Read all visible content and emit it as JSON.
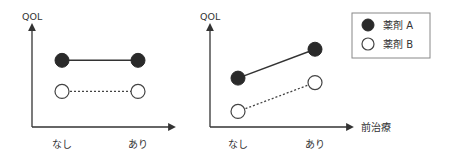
{
  "chart_data": [
    {
      "type": "line",
      "title": "",
      "xlabel": "",
      "ylabel": "QOL",
      "categories": [
        "なし",
        "あり"
      ],
      "series": [
        {
          "name": "薬剤 A",
          "values": [
            3,
            3
          ],
          "style": "solid",
          "marker": "filled"
        },
        {
          "name": "薬剤 B",
          "values": [
            1.6,
            1.6
          ],
          "style": "dotted",
          "marker": "open"
        }
      ],
      "ylim": [
        0,
        4.5
      ],
      "grid": false
    },
    {
      "type": "line",
      "title": "",
      "xlabel": "前治療",
      "ylabel": "QOL",
      "categories": [
        "なし",
        "あり"
      ],
      "series": [
        {
          "name": "薬剤 A",
          "values": [
            2.2,
            3.5
          ],
          "style": "solid",
          "marker": "filled"
        },
        {
          "name": "薬剤 B",
          "values": [
            0.7,
            2.0
          ],
          "style": "dotted",
          "marker": "open"
        }
      ],
      "ylim": [
        0,
        4.5
      ],
      "grid": false
    }
  ],
  "legend": {
    "placement": "top-right",
    "entries": [
      {
        "label": "薬剤 A",
        "marker": "filled"
      },
      {
        "label": "薬剤 B",
        "marker": "open"
      }
    ]
  },
  "colors": {
    "filled": "#2a2a2a",
    "line": "#333333",
    "open_fill": "#ffffff"
  }
}
